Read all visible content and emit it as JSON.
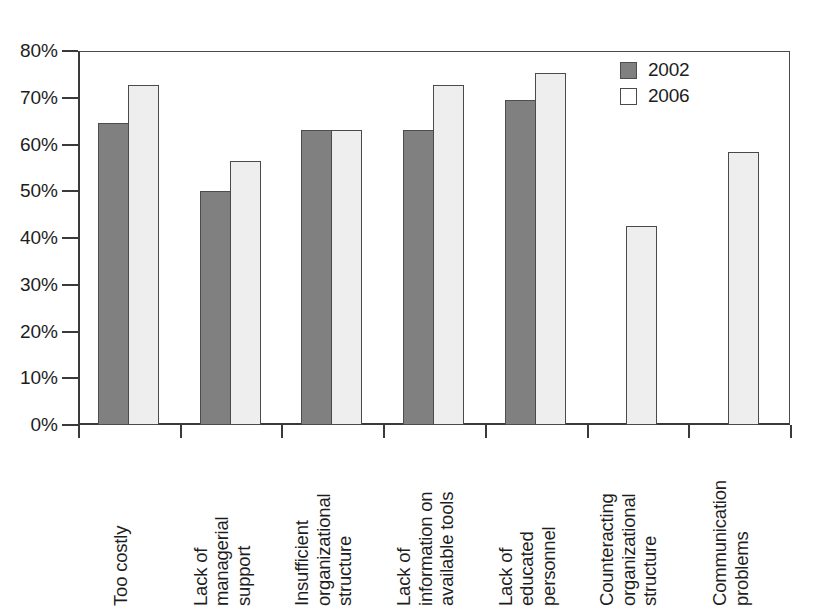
{
  "chart_data": {
    "type": "bar",
    "title": "",
    "subtitle": "",
    "xlabel": "",
    "ylabel": "",
    "ylim": [
      0,
      80
    ],
    "ytick_labels": [
      "0%",
      "10%",
      "20%",
      "30%",
      "40%",
      "50%",
      "60%",
      "70%",
      "80%"
    ],
    "ytick_values": [
      0,
      10,
      20,
      30,
      40,
      50,
      60,
      70,
      80
    ],
    "grid": false,
    "legend_position": "top-right",
    "categories": [
      "Too costly",
      "Lack of managerial support",
      "Insufficient organizational structure",
      "Lack of information on available tools",
      "Lack of educated personnel",
      "Counteracting organizational structure",
      "Communication problems"
    ],
    "category_lines": [
      [
        "Too costly"
      ],
      [
        "Lack of",
        "managerial",
        "support"
      ],
      [
        "Insufficient",
        "organizational",
        "structure"
      ],
      [
        "Lack of",
        "information on",
        "available tools"
      ],
      [
        "Lack of",
        "educated",
        "personnel"
      ],
      [
        "Counteracting",
        "organizational",
        "structure"
      ],
      [
        "Communication",
        "problems"
      ]
    ],
    "series": [
      {
        "name": "2002",
        "color": "#808080",
        "values": [
          64.5,
          50.0,
          63.0,
          63.0,
          69.5,
          null,
          null
        ]
      },
      {
        "name": "2006",
        "color": "#eeeeee",
        "values": [
          72.7,
          56.5,
          63.0,
          72.7,
          75.2,
          42.6,
          58.4
        ]
      }
    ]
  },
  "legend": {
    "items": [
      {
        "label": "2002",
        "swatch": "filled-gray-square"
      },
      {
        "label": "2006",
        "swatch": "empty-white-square"
      }
    ]
  }
}
